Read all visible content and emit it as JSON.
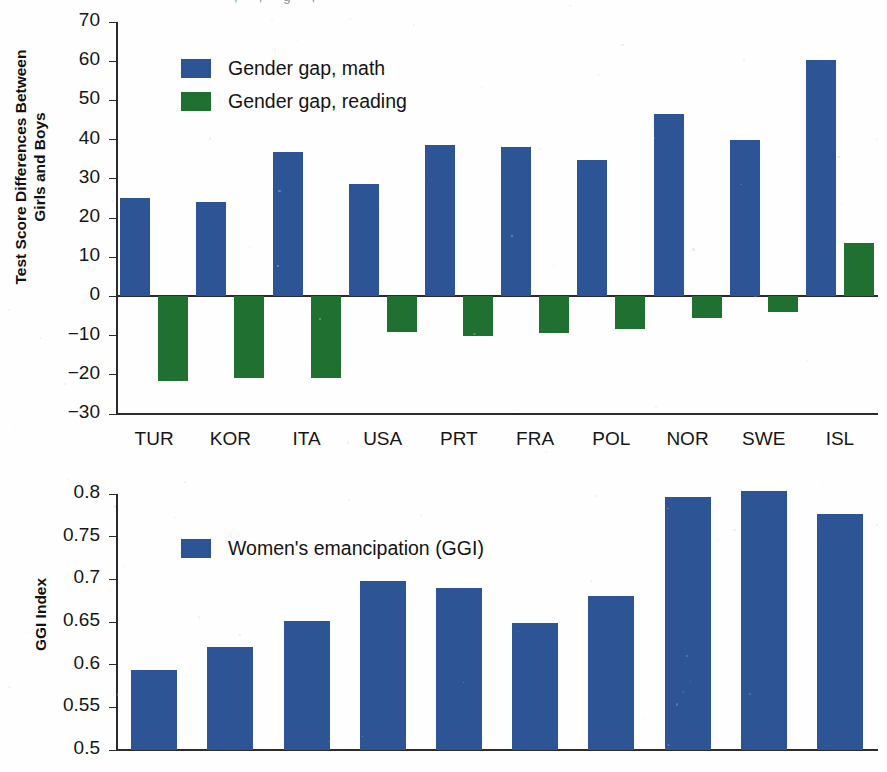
{
  "header": {
    "cropped_text": "    ,   ,   g   ,  "
  },
  "chart_data": [
    {
      "id": "gender-gap-chart",
      "type": "bar",
      "title": "",
      "xlabel": "",
      "ylabel": "Test Score Differences Between\nGirls and Boys",
      "ylim": [
        -30,
        70
      ],
      "yticks": [
        70,
        60,
        50,
        40,
        30,
        20,
        10,
        0,
        -10,
        -20,
        -30
      ],
      "ytick_labels": [
        "70",
        "60",
        "50",
        "40",
        "30",
        "20",
        "10",
        "0",
        "−10",
        "−20",
        "−30"
      ],
      "grid": false,
      "legend_position": "upper-left",
      "categories": [
        "TUR",
        "KOR",
        "ITA",
        "USA",
        "PRT",
        "FRA",
        "POL",
        "NOR",
        "SWE",
        "ISL"
      ],
      "series": [
        {
          "name": "Gender gap, math",
          "color": "#2d5494",
          "values": [
            25.0,
            24.1,
            36.8,
            28.8,
            38.6,
            38.0,
            34.8,
            46.5,
            39.9,
            60.4
          ]
        },
        {
          "name": "Gender gap, reading",
          "color": "#1f7031",
          "values": [
            -21.6,
            -20.9,
            -20.8,
            -9.2,
            -10.0,
            -9.4,
            -8.4,
            -5.4,
            -4.0,
            13.6
          ]
        }
      ]
    },
    {
      "id": "ggi-chart",
      "type": "bar",
      "title": "",
      "xlabel": "",
      "ylabel": "GGI Index",
      "ylim": [
        0.5,
        0.8
      ],
      "yticks": [
        0.8,
        0.75,
        0.7,
        0.65,
        0.6,
        0.55,
        0.5
      ],
      "ytick_labels": [
        "0.8",
        "0.75",
        "0.7",
        "0.65",
        "0.6",
        "0.55",
        "0.5"
      ],
      "grid": false,
      "legend_position": "upper-left",
      "categories": [
        "TUR",
        "KOR",
        "ITA",
        "USA",
        "PRT",
        "FRA",
        "POL",
        "NOR",
        "SWE",
        "ISL"
      ],
      "series": [
        {
          "name": "Women's emancipation (GGI)",
          "color": "#2d5494",
          "values": [
            0.594,
            0.621,
            0.651,
            0.698,
            0.69,
            0.649,
            0.681,
            0.797,
            0.803,
            0.776
          ]
        }
      ]
    }
  ]
}
